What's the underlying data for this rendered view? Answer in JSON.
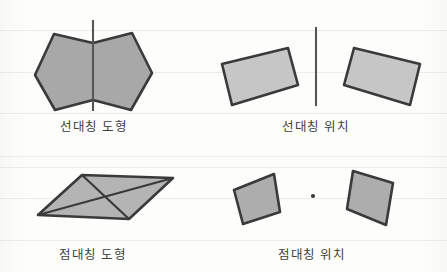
{
  "page": {
    "background_color": "#fdfdfb",
    "width": 447,
    "height": 272
  },
  "colors": {
    "stroke": "#3a3a3a",
    "fill_dark": "#a8a8a8",
    "fill_light": "#c6c6c6",
    "axis": "#555555",
    "center_point": "#3a3a3a",
    "caption_text": "#40403e",
    "rule_line": "#ececea"
  },
  "panels": [
    {
      "id": "line-symmetric-figure",
      "caption": "선대칭 도형",
      "quadrant": "top-left",
      "symmetry_type": "line",
      "has_axis_line": true,
      "axis_orientation": "vertical",
      "shape_count": 1,
      "shape_kind": "hexagon",
      "fill": "#a8a8a8"
    },
    {
      "id": "line-symmetric-position",
      "caption": "선대칭 위치",
      "quadrant": "top-right",
      "symmetry_type": "line",
      "has_axis_line": true,
      "axis_orientation": "vertical",
      "shape_count": 2,
      "shape_kind": "quadrilateral",
      "fill": "#c6c6c6"
    },
    {
      "id": "point-symmetric-figure",
      "caption": "점대칭 도형",
      "quadrant": "bottom-left",
      "symmetry_type": "point",
      "has_axis_line": false,
      "has_diagonals": true,
      "shape_count": 1,
      "shape_kind": "parallelogram",
      "fill": "#b4b4b4"
    },
    {
      "id": "point-symmetric-position",
      "caption": "점대칭 위치",
      "quadrant": "bottom-right",
      "symmetry_type": "point",
      "has_center_point": true,
      "shape_count": 2,
      "shape_kind": "quadrilateral",
      "fill": "#adadad"
    }
  ],
  "geometry": {
    "hexagon_points": "35,75 54,34 93,43 132,33 152,73 131,110 93,100 55,110",
    "line_pos_left_quad": "222,64 288,48 298,85 232,105",
    "line_pos_right_quad": "344,85 354,48 420,64 410,105",
    "line_axis_top_left": {
      "x": 93,
      "y1": 20,
      "y2": 111
    },
    "line_axis_top_right": {
      "x": 316,
      "y1": 27,
      "y2": 106
    },
    "parallelogram_points": "38,215 82,175 173,178 129,219",
    "parallelogram_diagonals": [
      {
        "x1": 38,
        "y1": 215,
        "x2": 173,
        "y2": 178
      },
      {
        "x1": 82,
        "y1": 175,
        "x2": 129,
        "y2": 219
      }
    ],
    "point_pos_left_quad": "234,190 274,174 280,212 243,224",
    "point_pos_right_quad": "347,209 353,171 393,183 386,225",
    "center_point": {
      "cx": 313,
      "cy": 196,
      "r": 2.1
    }
  },
  "captions": {
    "line_symmetric_figure": "선대칭 도형",
    "line_symmetric_position": "선대칭 위치",
    "point_symmetric_figure": "점대칭 도형",
    "point_symmetric_position": "점대칭 위치"
  }
}
